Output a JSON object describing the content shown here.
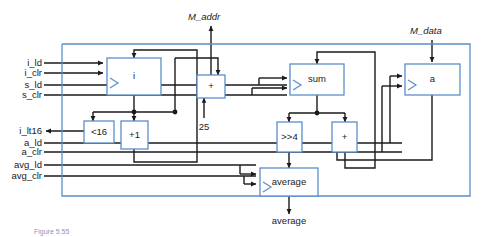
{
  "figure": {
    "type": "datapath-block-diagram",
    "caption_fragment": "Figure 5.55",
    "colors": {
      "block_border": "#5b8fc9",
      "block_fill": "#ffffff",
      "boundary": "#5b8fc9",
      "wire": "#1a1a1a",
      "text": "#1a1a1a",
      "caption": "#20408a"
    }
  },
  "external_inputs": {
    "top": [
      {
        "name": "M_addr",
        "label": "M_addr",
        "direction": "out"
      },
      {
        "name": "M_data",
        "label": "M_data",
        "direction": "in"
      }
    ],
    "left": [
      {
        "name": "i_ld",
        "label": "i_ld",
        "direction": "in"
      },
      {
        "name": "i_clr",
        "label": "i_clr",
        "direction": "in"
      },
      {
        "name": "s_ld",
        "label": "s_ld",
        "direction": "in"
      },
      {
        "name": "s_clr",
        "label": "s_clr",
        "direction": "in"
      },
      {
        "name": "i_lt16",
        "label": "i_lt16",
        "direction": "out"
      },
      {
        "name": "a_ld",
        "label": "a_ld",
        "direction": "in"
      },
      {
        "name": "a_clr",
        "label": "a_clr",
        "direction": "in"
      },
      {
        "name": "avg_ld",
        "label": "avg_ld",
        "direction": "in"
      },
      {
        "name": "avg_clr",
        "label": "avg_clr",
        "direction": "in"
      }
    ],
    "bottom": [
      {
        "name": "average",
        "label": "average",
        "direction": "out"
      }
    ]
  },
  "constants": [
    {
      "name": "const-25",
      "label": "25"
    }
  ],
  "blocks": [
    {
      "id": "reg_i",
      "label": "i",
      "kind": "register"
    },
    {
      "id": "add_addr",
      "label": "+",
      "kind": "adder"
    },
    {
      "id": "reg_sum",
      "label": "sum",
      "kind": "register"
    },
    {
      "id": "reg_a",
      "label": "a",
      "kind": "register"
    },
    {
      "id": "cmp_lt16",
      "label": "<16",
      "kind": "comparator"
    },
    {
      "id": "inc_1",
      "label": "+1",
      "kind": "incrementer"
    },
    {
      "id": "shr_4",
      "label": ">>4",
      "kind": "shifter"
    },
    {
      "id": "add_sum",
      "label": "+",
      "kind": "adder"
    },
    {
      "id": "reg_avg",
      "label": "average",
      "kind": "register"
    }
  ]
}
